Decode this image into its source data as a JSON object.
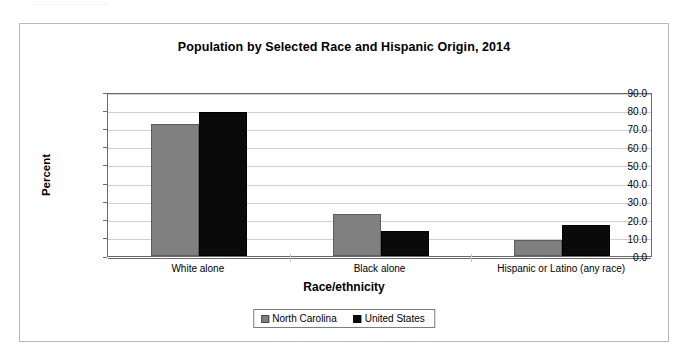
{
  "page": {
    "header_strip_text": "................................................................."
  },
  "chart_data": {
    "type": "bar",
    "title": "Population by Selected Race and Hispanic Origin, 2014",
    "xlabel": "Race/ethnicity",
    "ylabel": "Percent",
    "categories": [
      "White alone",
      "Black alone",
      "Hispanic or Latino (any race)"
    ],
    "series": [
      {
        "name": "North Carolina",
        "color": "#808080",
        "values": [
          72.6,
          22.9,
          8.9
        ]
      },
      {
        "name": "United States",
        "color": "#0a0a0a",
        "values": [
          78.9,
          13.7,
          16.8
        ]
      }
    ],
    "ylim": [
      0,
      90
    ],
    "ytick_step": 10,
    "ytick_labels": [
      "90.0",
      "80.0",
      "70.0",
      "60.0",
      "50.0",
      "40.0",
      "30.0",
      "20.0",
      "10.0",
      "0.0"
    ],
    "ytick_values": [
      90,
      80,
      70,
      60,
      50,
      40,
      30,
      20,
      10,
      0
    ],
    "grid": true,
    "legend_position": "bottom"
  }
}
